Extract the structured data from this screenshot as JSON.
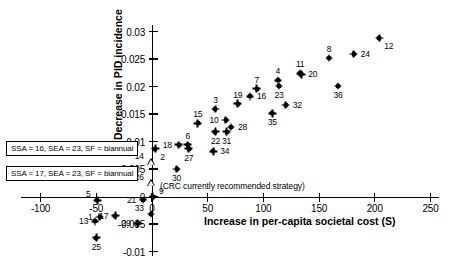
{
  "chart_data": {
    "type": "scatter",
    "title": "",
    "xlabel": "Increase in per-capita societal cost (S)",
    "ylabel": "Decrease in PID incidence",
    "xlim": [
      -120,
      260
    ],
    "ylim": [
      -0.0115,
      0.0315
    ],
    "xticks": [
      "-100",
      "-50",
      "0",
      "50",
      "100",
      "150",
      "200",
      "250"
    ],
    "xtick_values": [
      -100,
      -50,
      0,
      50,
      100,
      150,
      200,
      250
    ],
    "yticks": [
      "0.03",
      "0.025",
      "0.02",
      "0.015",
      "0.01",
      "0.005",
      "0",
      "-0.005",
      "-0.01"
    ],
    "ytick_values": [
      0.03,
      0.025,
      0.02,
      0.015,
      0.01,
      0.005,
      0,
      -0.005,
      -0.01
    ],
    "grid": false,
    "legend_position": "left-middle",
    "marker_color": "#000000",
    "points": [
      {
        "label": "1",
        "x": -47,
        "y": -0.0037,
        "marker": "diamond",
        "label_pos": "left"
      },
      {
        "label": "2",
        "x": 3,
        "y": 0.0087,
        "marker": "diamond",
        "label_pos": "below-right"
      },
      {
        "label": "3",
        "x": 57,
        "y": 0.0159,
        "marker": "diamond",
        "label_pos": "above"
      },
      {
        "label": "4",
        "x": 113,
        "y": 0.0211,
        "marker": "diamond",
        "label_pos": "above"
      },
      {
        "label": "5",
        "x": -49,
        "y": -0.0007,
        "marker": "diamond",
        "label_pos": "above-left"
      },
      {
        "label": "6",
        "x": 32,
        "y": 0.0094,
        "marker": "diamond",
        "label_pos": "above"
      },
      {
        "label": "7",
        "x": 94,
        "y": 0.0196,
        "marker": "diamond",
        "label_pos": "above"
      },
      {
        "label": "8",
        "x": 159,
        "y": 0.0252,
        "marker": "diamond",
        "label_pos": "above"
      },
      {
        "label": "9",
        "x": 1,
        "y": 0.0,
        "marker": "diamond",
        "label_pos": "above-right"
      },
      {
        "label": "10",
        "x": 66,
        "y": 0.0139,
        "marker": "diamond",
        "label_pos": "left"
      },
      {
        "label": "11",
        "x": 133,
        "y": 0.0224,
        "marker": "diamond",
        "label_pos": "above"
      },
      {
        "label": "12",
        "x": 204,
        "y": 0.0288,
        "marker": "diamond",
        "label_pos": "below-right"
      },
      {
        "label": "13",
        "x": -51,
        "y": -0.0045,
        "marker": "diamond",
        "label_pos": "left"
      },
      {
        "label": "14",
        "x": -1,
        "y": 0.0062,
        "marker": "triangle",
        "label_pos": "above-left"
      },
      {
        "label": "15",
        "x": 41,
        "y": 0.0133,
        "marker": "diamond",
        "label_pos": "above"
      },
      {
        "label": "16",
        "x": 88,
        "y": 0.0182,
        "marker": "diamond",
        "label_pos": "right"
      },
      {
        "label": "17",
        "x": -33,
        "y": -0.0035,
        "marker": "diamond",
        "label_pos": "left"
      },
      {
        "label": "18",
        "x": 24,
        "y": 0.0094,
        "marker": "diamond",
        "label_pos": "left"
      },
      {
        "label": "19",
        "x": 77,
        "y": 0.0169,
        "marker": "diamond",
        "label_pos": "above"
      },
      {
        "label": "20",
        "x": 134,
        "y": 0.0222,
        "marker": "diamond",
        "label_pos": "right"
      },
      {
        "label": "21",
        "x": -8,
        "y": -0.0006,
        "marker": "diamond",
        "label_pos": "left"
      },
      {
        "label": "22",
        "x": 57,
        "y": 0.0118,
        "marker": "diamond",
        "label_pos": "below"
      },
      {
        "label": "23",
        "x": 114,
        "y": 0.0201,
        "marker": "diamond",
        "label_pos": "below"
      },
      {
        "label": "24",
        "x": 181,
        "y": 0.0259,
        "marker": "diamond",
        "label_pos": "right"
      },
      {
        "label": "25",
        "x": -50,
        "y": -0.0075,
        "marker": "diamond",
        "label_pos": "below"
      },
      {
        "label": "26",
        "x": -1,
        "y": 0.0024,
        "marker": "triangle",
        "label_pos": "above-left"
      },
      {
        "label": "27",
        "x": 33,
        "y": 0.0087,
        "marker": "diamond",
        "label_pos": "below"
      },
      {
        "label": "28",
        "x": 71,
        "y": 0.0126,
        "marker": "diamond",
        "label_pos": "right"
      },
      {
        "label": "29",
        "x": -13,
        "y": -0.0049,
        "marker": "diamond",
        "label_pos": "left"
      },
      {
        "label": "30",
        "x": 22,
        "y": 0.005,
        "marker": "diamond",
        "label_pos": "below"
      },
      {
        "label": "31",
        "x": 67,
        "y": 0.0118,
        "marker": "diamond",
        "label_pos": "below"
      },
      {
        "label": "32",
        "x": 120,
        "y": 0.0166,
        "marker": "diamond",
        "label_pos": "right"
      },
      {
        "label": "33",
        "x": -1,
        "y": -0.0032,
        "marker": "diamond",
        "label_pos": "above-left"
      },
      {
        "label": "34",
        "x": 55,
        "y": 0.0082,
        "marker": "diamond",
        "label_pos": "right"
      },
      {
        "label": "35",
        "x": 108,
        "y": 0.0151,
        "marker": "diamond",
        "label_pos": "below"
      },
      {
        "label": "36",
        "x": 167,
        "y": 0.0201,
        "marker": "diamond",
        "label_pos": "below"
      }
    ],
    "legend_boxes": [
      {
        "text": "SSA = 16, SEA = 23, SF = biannual",
        "points_to": "14"
      },
      {
        "text": "SSA = 17, SEA = 23, SF = biannual",
        "points_to": "26"
      }
    ],
    "annotations": [
      {
        "text": "(CRC currently recommended strategy)"
      }
    ]
  }
}
